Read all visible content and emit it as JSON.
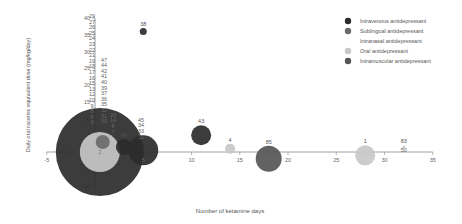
{
  "chart_data": {
    "type": "scatter",
    "subtype": "bubble",
    "title": "",
    "xlabel": "Number of ketamine days",
    "ylabel": "Daily oral racemic equivalent dose (mg/kg/day)",
    "xlim": [
      -5,
      35
    ],
    "ylim": [
      -10,
      40
    ],
    "xticks": [
      -5,
      0,
      5,
      10,
      15,
      20,
      25,
      30,
      35
    ],
    "yticks": [
      -10,
      -5,
      0,
      5,
      10,
      15,
      20,
      25,
      30,
      35,
      40
    ],
    "grid": false,
    "legend_position": "top-right",
    "legend": [
      {
        "name": "Intravenous antidepressant",
        "color": "#2b2b2b"
      },
      {
        "name": "Sublingual antidepressant",
        "color": "#6b6b6b"
      },
      {
        "name": "Intranasal antidepressant",
        "color": "#ffffff"
      },
      {
        "name": "Oral antidepressant",
        "color": "#c8c8c8"
      },
      {
        "name": "Intramuscular antidepressant",
        "color": "#555555"
      }
    ],
    "bubbles": [
      {
        "x": 0.5,
        "y": 0,
        "r": 44,
        "series": "Intravenous antidepressant",
        "label": ""
      },
      {
        "x": 0.5,
        "y": 0,
        "r": 20,
        "series": "Oral antidepressant",
        "label": "2"
      },
      {
        "x": 0.8,
        "y": 3,
        "r": 7,
        "series": "Sublingual antidepressant",
        "label": ""
      },
      {
        "x": 3,
        "y": 1.5,
        "r": 8,
        "series": "Intravenous antidepressant",
        "label": "46"
      },
      {
        "x": 5,
        "y": 0.5,
        "r": 15,
        "series": "Intravenous antidepressant",
        "label": ""
      },
      {
        "x": 5,
        "y": 36,
        "r": 3.5,
        "series": "Intravenous antidepressant",
        "label": "38"
      },
      {
        "x": 11,
        "y": 5,
        "r": 10,
        "series": "Intravenous antidepressant",
        "label": "43"
      },
      {
        "x": 14,
        "y": 1,
        "r": 5,
        "series": "Oral antidepressant",
        "label": "4"
      },
      {
        "x": 18,
        "y": -2,
        "r": 13,
        "series": "Intramuscular antidepressant",
        "label": "85"
      },
      {
        "x": 28,
        "y": -1,
        "r": 10,
        "series": "Oral antidepressant",
        "label": "1"
      },
      {
        "x": 32,
        "y": 1.5,
        "r": 1.5,
        "series": "Oral antidepressant",
        "label": "83"
      }
    ],
    "label_columns": [
      {
        "x_px": 92,
        "top_y": 40,
        "labels": [
          "29",
          "27",
          "26",
          "25",
          "24",
          "23",
          "22",
          "21",
          "19",
          "18",
          "17",
          "16",
          "15",
          "13",
          "12",
          "10",
          "9",
          "8",
          "6",
          "3"
        ]
      },
      {
        "x_px": 104,
        "top_y": 27,
        "labels": [
          "47",
          "44",
          "42",
          "41",
          "40",
          "39",
          "37",
          "36",
          "35",
          "32",
          "31",
          "30"
        ]
      },
      {
        "x_px": 113,
        "top_y": 10.5,
        "labels": [
          "20",
          "14",
          "8",
          "7"
        ]
      },
      {
        "x_px": 141,
        "top_y": 9,
        "labels": [
          "45",
          "34",
          "33",
          "11"
        ]
      }
    ],
    "annotations": [
      {
        "text": "5",
        "x": 5,
        "y": -2.5
      },
      {
        "text": "50",
        "x": 32,
        "y": 0.5
      }
    ]
  }
}
